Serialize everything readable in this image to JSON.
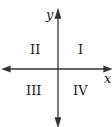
{
  "diagram": {
    "type": "cartesian-quadrants",
    "axes": {
      "x_label": "x",
      "y_label": "y"
    },
    "quadrants": [
      {
        "id": "q1",
        "label": "I"
      },
      {
        "id": "q2",
        "label": "II"
      },
      {
        "id": "q3",
        "label": "III"
      },
      {
        "id": "q4",
        "label": "IV"
      }
    ],
    "colors": {
      "line": "#333333",
      "text": "#1a1a1a"
    }
  }
}
